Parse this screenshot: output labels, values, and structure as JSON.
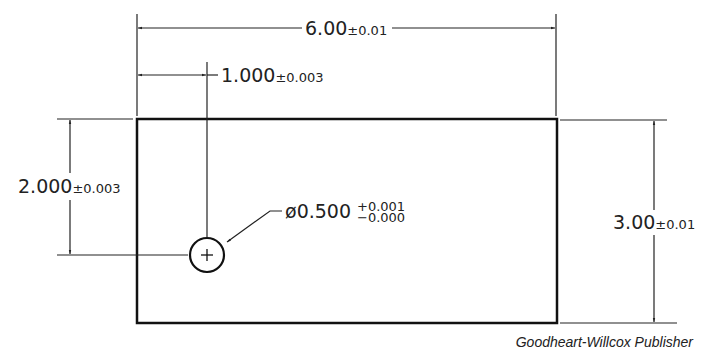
{
  "drawing": {
    "width_dim": {
      "value": "6.00",
      "tol": "±0.01"
    },
    "hole_x_dim": {
      "value": "1.000",
      "tol": "±0.003"
    },
    "hole_y_dim": {
      "value": "2.000",
      "tol": "±0.003"
    },
    "height_dim": {
      "value": "3.00",
      "tol": "±0.01"
    },
    "hole_callout": {
      "symbol": "ø",
      "value": "0.500",
      "upper_tol": "+0.001",
      "lower_tol": "−0.000"
    }
  },
  "credit": "Goodheart-Willcox Publisher"
}
